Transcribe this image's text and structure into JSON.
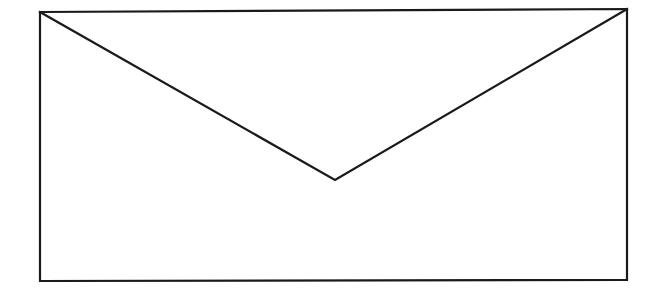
{
  "figure": {
    "icon": "envelope-icon",
    "stroke_color": "#1a1a1a",
    "background_color": "#ffffff",
    "body": {
      "top_left": [
        40,
        12
      ],
      "top_right": [
        627,
        9
      ],
      "bottom_right": [
        627,
        280
      ],
      "bottom_left": [
        40,
        281
      ]
    },
    "flap": {
      "left": [
        40,
        12
      ],
      "vertex": [
        335,
        180
      ],
      "right": [
        627,
        9
      ]
    }
  }
}
